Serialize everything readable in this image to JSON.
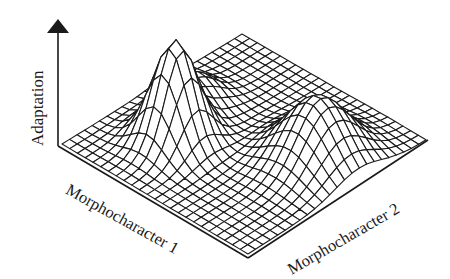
{
  "chart_data": {
    "type": "surface-wireframe",
    "title": "",
    "axes": {
      "z_label": "Adaptation",
      "x_label": "Morphocharacter 1",
      "y_label": "Morphocharacter 2"
    },
    "grid": {
      "rows": 24,
      "cols": 24
    },
    "peaks": [
      {
        "name": "sharp-peak",
        "u": 0.3,
        "v": 0.32,
        "height": 1.0,
        "spread": 0.09
      },
      {
        "name": "broad-peak",
        "u": 0.78,
        "v": 0.62,
        "height": 0.62,
        "spread": 0.13
      },
      {
        "name": "side-shoulder",
        "u": 0.18,
        "v": 0.55,
        "height": 0.28,
        "spread": 0.09
      }
    ],
    "annotations": [
      "Upward arrow on Adaptation axis"
    ]
  },
  "colors": {
    "line": "#1a1a1a",
    "background": "#ffffff"
  }
}
